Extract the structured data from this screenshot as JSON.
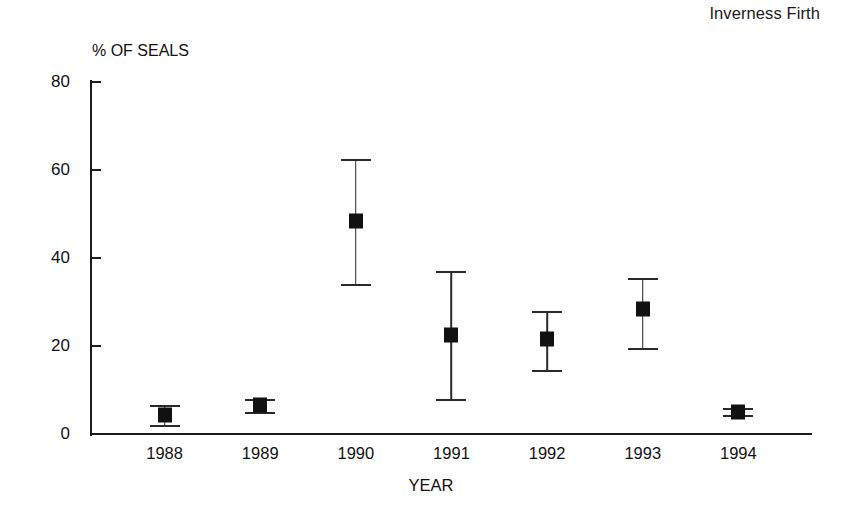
{
  "chart_data": {
    "type": "scatter",
    "title": "Inverness Firth",
    "xlabel": "YEAR",
    "ylabel": "% OF SEALS",
    "categories": [
      "1988",
      "1989",
      "1990",
      "1991",
      "1992",
      "1993",
      "1994"
    ],
    "values": [
      4.3,
      6.5,
      48.5,
      22.5,
      21.5,
      28.5,
      5.0
    ],
    "error_low": [
      2.0,
      5.0,
      34.0,
      8.0,
      14.5,
      19.5,
      4.3
    ],
    "error_high": [
      6.5,
      8.0,
      62.5,
      37.0,
      28.0,
      35.5,
      5.8
    ],
    "ylim": [
      0,
      80
    ],
    "yticks": [
      0,
      20,
      40,
      60,
      80
    ],
    "ytick_labels": [
      "0",
      "20",
      "40",
      "60",
      "80"
    ],
    "grid": false,
    "legend": "none",
    "marker": "filled-square",
    "error_bar_style": "capped-vertical",
    "series_name": "% of seals"
  },
  "figure": {
    "title_position": "top-right",
    "ylabel_position": "above-axis",
    "axis_color": "#1d1d1d",
    "marker_color": "#111111",
    "background": "#ffffff"
  }
}
